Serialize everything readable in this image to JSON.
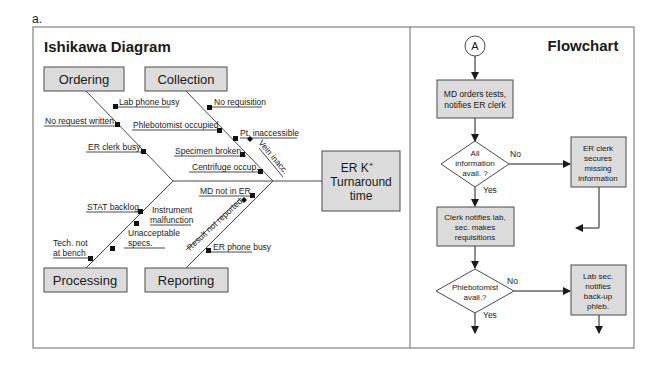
{
  "figure_label": "a.",
  "ishikawa": {
    "title": "Ishikawa Diagram",
    "effect": {
      "line1": "ER K",
      "sup": "+",
      "line2": "Turnaround",
      "line3": "time"
    },
    "categories": {
      "ordering": "Ordering",
      "collection": "Collection",
      "processing": "Processing",
      "reporting": "Reporting"
    },
    "causes": {
      "ordering": [
        "Lab phone busy",
        "No request written",
        "ER clerk busy"
      ],
      "collection": [
        "No requisition",
        "Phlebotomist occupied",
        "Pt. inaccessible",
        "Vein inacc.",
        "Specimen broken",
        "Centrifuge occup."
      ],
      "processing": [
        "STAT backlog",
        "Instrument",
        "malfunction",
        "Unacceptable",
        "specs.",
        "Tech. not",
        "at bench"
      ],
      "reporting": [
        "MD not in ER",
        "Result not reported",
        "ER phone busy"
      ]
    }
  },
  "flowchart": {
    "title": "Flowchart",
    "connector": "A",
    "steps": {
      "md_orders": [
        "MD orders tests,",
        "notifies ER clerk"
      ],
      "decision_info": [
        "All",
        "information",
        "avail. ?"
      ],
      "er_clerk_secures": [
        "ER clerk",
        "secures",
        "missing",
        "information"
      ],
      "clerk_notifies": [
        "Clerk notifies lab,",
        "sec. makes",
        "requisitions"
      ],
      "decision_phleb": [
        "Phlebotomist",
        "avail.?"
      ],
      "lab_sec_notifies": [
        "Lab sec.",
        "notifies",
        "back-up",
        "phleb."
      ]
    },
    "labels": {
      "no": "No",
      "yes": "Yes"
    }
  },
  "colors": {
    "box_fill": "#dcdcdc",
    "stroke": "#4a4a4a",
    "frame": "#6a6a6a"
  }
}
